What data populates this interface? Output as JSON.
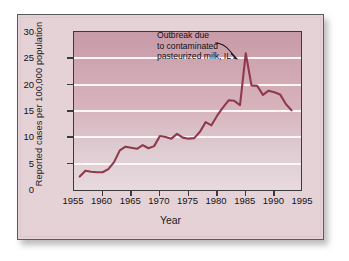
{
  "figure": {
    "frame_color": "#5d5a5e",
    "panel_background": "#e5d2d7",
    "line_color": "#8e3a4c",
    "gridline_color": "#fdf6f7"
  },
  "axes": {
    "xlabel": "Year",
    "ylabel": "Reported cases per 100,000 population",
    "x_ticks": [
      "1955",
      "1960",
      "1965",
      "1970",
      "1975",
      "1980",
      "1985",
      "1990",
      "1995"
    ],
    "y_ticks": [
      "0",
      "5",
      "10",
      "15",
      "20",
      "25",
      "30"
    ]
  },
  "annotation": {
    "line1": "Outbreak due",
    "line2": "to contaminated",
    "line3": "pasteurized milk, IL",
    "points_to_year": 1985,
    "points_to_value": 26.0
  },
  "chart_data": {
    "type": "line",
    "title": "",
    "subtitle": "",
    "xlabel": "Year",
    "ylabel": "Reported cases per 100,000 population",
    "xlim": [
      1955,
      1995
    ],
    "ylim": [
      0,
      30
    ],
    "xticks": [
      1955,
      1960,
      1965,
      1970,
      1975,
      1980,
      1985,
      1990,
      1995
    ],
    "yticks": [
      0,
      5,
      10,
      15,
      20,
      25,
      30
    ],
    "grid": "horizontal",
    "legend": "none",
    "annotations": [
      {
        "text": "Outbreak due to contaminated pasteurized milk, IL",
        "x": 1985,
        "y": 26.0
      }
    ],
    "series": [
      {
        "name": "Reported salmonellosis cases per 100,000 population",
        "x": [
          1956,
          1957,
          1958,
          1959,
          1960,
          1961,
          1962,
          1963,
          1964,
          1965,
          1966,
          1967,
          1968,
          1969,
          1970,
          1971,
          1972,
          1973,
          1974,
          1975,
          1976,
          1977,
          1978,
          1979,
          1980,
          1981,
          1982,
          1983,
          1984,
          1985,
          1986,
          1987,
          1988,
          1989,
          1990,
          1991,
          1992,
          1993
        ],
        "values": [
          2.9,
          4.0,
          3.8,
          3.7,
          3.7,
          4.3,
          5.6,
          7.8,
          8.5,
          8.3,
          8.1,
          8.8,
          8.2,
          8.6,
          10.5,
          10.3,
          10.0,
          10.9,
          10.2,
          10.0,
          10.1,
          11.3,
          13.1,
          12.5,
          14.3,
          15.8,
          17.2,
          17.1,
          16.3,
          26.0,
          20.0,
          19.9,
          18.2,
          19.0,
          18.7,
          18.3,
          16.5,
          15.3
        ]
      }
    ]
  }
}
